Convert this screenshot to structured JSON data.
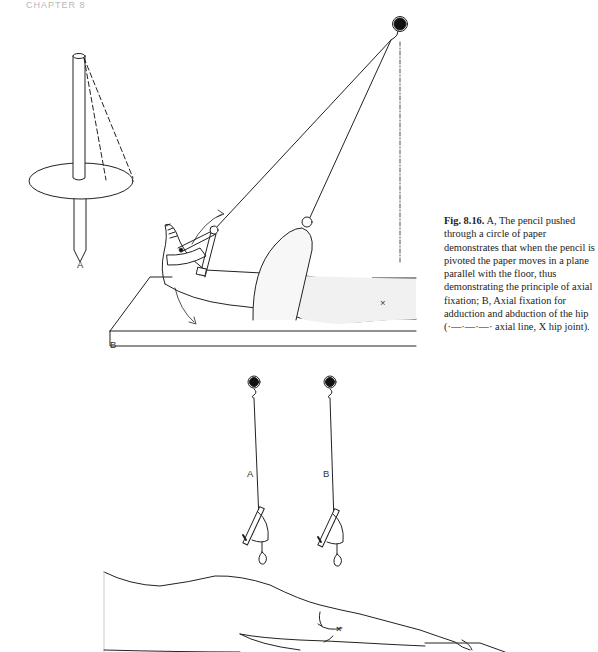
{
  "page": {
    "running_head": "CHAPTER 8"
  },
  "figure": {
    "number_label": "Fig. 8.16.",
    "caption_text": "A, The pencil pushed through a circle of paper demonstrates that when the pencil is pivoted the paper moves in a plane parallel with the floor, thus demonstrating the principle of axial fixation; B, Axial fixation for adduction and abduction of the hip (·—·—·—· axial line, X hip joint).",
    "panels": {
      "upper_left": {
        "label": "A",
        "subject": "pencil through paper disc"
      },
      "upper_right": {
        "label": "B",
        "subject": "leg suspended on plinth with axial fixation",
        "joint_mark": "×"
      },
      "lower": {
        "labels": [
          "A",
          "B"
        ],
        "subject": "two suspension points over leg",
        "joint_mark": "×"
      }
    }
  }
}
